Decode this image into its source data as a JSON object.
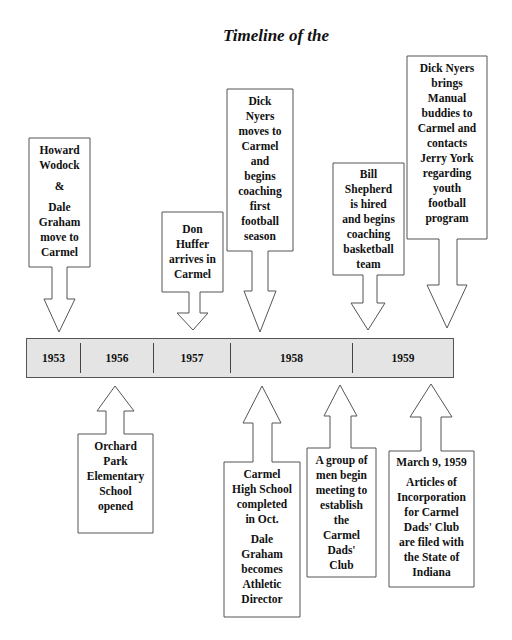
{
  "title": "Timeline of the",
  "colors": {
    "bar_fill": "#e4e4e4",
    "outline": "#555555",
    "text": "#111111",
    "background": "#ffffff"
  },
  "timeline": {
    "years": [
      "1953",
      "1956",
      "1957",
      "1958",
      "1959"
    ]
  },
  "events_above": [
    {
      "year": "1953",
      "lines": [
        "Howard",
        "Wodock",
        "&",
        "Dale",
        "Graham",
        "move to",
        "Carmel"
      ]
    },
    {
      "year": "1957",
      "lines": [
        "Don",
        "Huffer",
        "arrives in",
        "Carmel"
      ]
    },
    {
      "year": "1958",
      "lines": [
        "Dick",
        "Nyers",
        "moves to",
        "Carmel",
        "and",
        "begins",
        "coaching",
        "first",
        "football",
        "season"
      ]
    },
    {
      "year": "1958",
      "lines": [
        "Bill",
        "Shepherd",
        "is hired",
        "and begins",
        "coaching",
        "basketball",
        "team"
      ]
    },
    {
      "year": "1959",
      "lines": [
        "Dick Nyers",
        "brings",
        "Manual",
        "buddies to",
        "Carmel and",
        "contacts",
        "Jerry York",
        "regarding",
        "youth",
        "football",
        "program"
      ]
    }
  ],
  "events_below": [
    {
      "year": "1956",
      "lines": [
        "Orchard",
        "Park",
        "Elementary",
        "School",
        "opened"
      ]
    },
    {
      "year": "1958",
      "lines": [
        "Carmel",
        "High School",
        "completed",
        "in Oct."
      ],
      "lines2": [
        "Dale",
        "Graham",
        "becomes",
        "Athletic",
        "Director"
      ]
    },
    {
      "year": "1958",
      "lines": [
        "A group of",
        "men begin",
        "meeting to",
        "establish",
        "the",
        "Carmel",
        "Dads'",
        "Club"
      ]
    },
    {
      "year": "1959",
      "date": "March 9, 1959",
      "lines": [
        "Articles of",
        "Incorporation",
        "for Carmel",
        "Dads' Club",
        "are filed with",
        "the State of",
        "Indiana"
      ]
    }
  ]
}
